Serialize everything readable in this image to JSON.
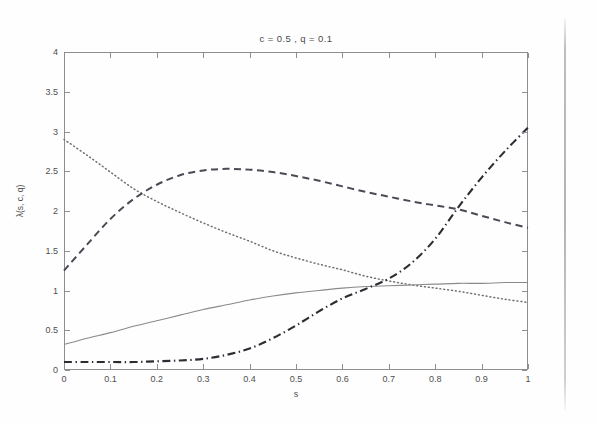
{
  "figure": {
    "title": "c = 0.5 , q = 0.1",
    "xlabel": "s",
    "ylabel": "λ(s, c, q)",
    "axis_color": "#8e8e92",
    "text_color": "#4e4e4e",
    "background": "#fefefe"
  },
  "chart_data": {
    "type": "line",
    "title": "c = 0.5 , q = 0.1",
    "xlabel": "s",
    "ylabel": "λ(s, c, q)",
    "xlim": [
      0,
      1
    ],
    "ylim": [
      0,
      4
    ],
    "xticks": [
      "0",
      "0.1",
      "0.2",
      "0.3",
      "0.4",
      "0.5",
      "0.6",
      "0.7",
      "0.8",
      "0.9",
      "1"
    ],
    "xtick_values": [
      0,
      0.1,
      0.2,
      0.3,
      0.4,
      0.5,
      0.6,
      0.7,
      0.8,
      0.9,
      1
    ],
    "yticks": [
      "0",
      "0.5",
      "1",
      "1.5",
      "2",
      "2.5",
      "3",
      "3.5",
      "4"
    ],
    "ytick_values": [
      0,
      0.5,
      1,
      1.5,
      2,
      2.5,
      3,
      3.5,
      4
    ],
    "grid": false,
    "legend": "none",
    "x": [
      0,
      0.05,
      0.1,
      0.15,
      0.2,
      0.25,
      0.3,
      0.35,
      0.4,
      0.45,
      0.5,
      0.55,
      0.6,
      0.65,
      0.7,
      0.75,
      0.8,
      0.85,
      0.9,
      0.95,
      1
    ],
    "series": [
      {
        "name": "dotted-decreasing",
        "style": "dotted",
        "color": "#707070",
        "values": [
          2.9,
          2.7,
          2.49,
          2.28,
          2.12,
          1.98,
          1.85,
          1.73,
          1.62,
          1.5,
          1.41,
          1.33,
          1.26,
          1.18,
          1.12,
          1.07,
          1.03,
          0.99,
          0.94,
          0.89,
          0.85
        ]
      },
      {
        "name": "dashed-humped",
        "style": "dashed",
        "color": "#4a4a55",
        "values": [
          1.25,
          1.58,
          1.9,
          2.15,
          2.33,
          2.45,
          2.51,
          2.53,
          2.52,
          2.49,
          2.44,
          2.38,
          2.31,
          2.24,
          2.18,
          2.12,
          2.07,
          2.02,
          1.94,
          1.86,
          1.79
        ]
      },
      {
        "name": "solid-saturating",
        "style": "solid",
        "color": "#8a8a8a",
        "values": [
          0.32,
          0.4,
          0.47,
          0.55,
          0.62,
          0.69,
          0.76,
          0.82,
          0.88,
          0.93,
          0.97,
          1.0,
          1.03,
          1.05,
          1.06,
          1.07,
          1.08,
          1.09,
          1.09,
          1.1,
          1.1
        ]
      },
      {
        "name": "dash-dot-rising",
        "style": "dashdot",
        "color": "#2c2c33",
        "values": [
          0.1,
          0.1,
          0.1,
          0.1,
          0.11,
          0.12,
          0.14,
          0.19,
          0.27,
          0.4,
          0.56,
          0.74,
          0.9,
          1.02,
          1.15,
          1.35,
          1.65,
          2.05,
          2.42,
          2.75,
          3.05
        ]
      }
    ]
  }
}
